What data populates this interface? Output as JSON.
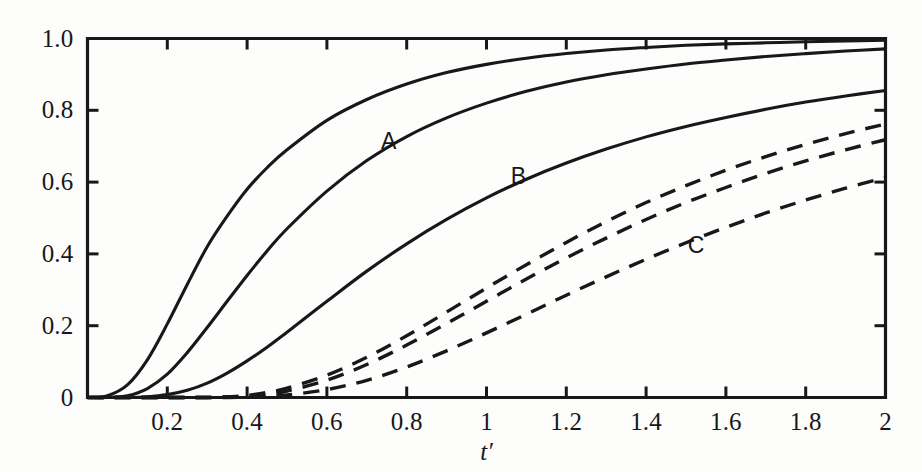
{
  "figure": {
    "background_color": "#fdfdfc",
    "ink_color": "#18181b",
    "x_axis_title": "t′"
  },
  "axes": {
    "x_ticks": [
      "0.2",
      "0.4",
      "0.6",
      "0.8",
      "1",
      "1.2",
      "1.4",
      "1.6",
      "1.8",
      "2"
    ],
    "x_tick_values": [
      0.2,
      0.4,
      0.6,
      0.8,
      1,
      1.2,
      1.4,
      1.6,
      1.8,
      2
    ],
    "y_ticks": [
      "0",
      "0.2",
      "0.4",
      "0.6",
      "0.8",
      "1.0"
    ],
    "y_tick_values": [
      0,
      0.2,
      0.4,
      0.6,
      0.8,
      1.0
    ]
  },
  "curve_labels": [
    {
      "text": "A",
      "x": 0.755,
      "y": 0.715
    },
    {
      "text": "B",
      "x": 1.08,
      "y": 0.616
    },
    {
      "text": "C",
      "x": 1.525,
      "y": 0.425
    },
    {
      "text": "D",
      "x": 2.33,
      "y": 0.465
    },
    {
      "text": "E",
      "x": 2.73,
      "y": 0.44
    },
    {
      "text": "F",
      "x": 3.14,
      "y": 0.425
    }
  ],
  "chart_data": {
    "type": "line",
    "title": "",
    "subtitle": "",
    "xlabel": "t′",
    "ylabel": "",
    "xlim": [
      0,
      2
    ],
    "ylim": [
      0,
      1.0
    ],
    "grid": false,
    "legend": "inline-curve-labels",
    "x_tick_labels": [
      "0.2",
      "0.4",
      "0.6",
      "0.8",
      "1",
      "1.2",
      "1.4",
      "1.6",
      "1.8",
      "2"
    ],
    "y_tick_labels": [
      "0",
      "0.2",
      "0.4",
      "0.6",
      "0.8",
      "1.0"
    ],
    "x": [
      0,
      0.05,
      0.1,
      0.15,
      0.2,
      0.25,
      0.3,
      0.35,
      0.4,
      0.45,
      0.5,
      0.6,
      0.7,
      0.8,
      0.9,
      1.0,
      1.1,
      1.2,
      1.3,
      1.4,
      1.5,
      1.6,
      1.7,
      1.8,
      1.9,
      2.0
    ],
    "series": [
      {
        "name": "A",
        "style": "solid",
        "color": "#18181b",
        "values": [
          0,
          0.005,
          0.035,
          0.105,
          0.205,
          0.315,
          0.42,
          0.505,
          0.58,
          0.64,
          0.69,
          0.772,
          0.83,
          0.873,
          0.905,
          0.928,
          0.945,
          0.958,
          0.968,
          0.975,
          0.981,
          0.985,
          0.988,
          0.991,
          0.993,
          0.995
        ]
      },
      {
        "name": "B",
        "style": "solid",
        "color": "#18181b",
        "values": [
          0,
          0.0,
          0.005,
          0.025,
          0.065,
          0.125,
          0.195,
          0.268,
          0.34,
          0.408,
          0.47,
          0.575,
          0.66,
          0.727,
          0.779,
          0.82,
          0.853,
          0.879,
          0.899,
          0.915,
          0.929,
          0.94,
          0.95,
          0.958,
          0.965,
          0.971
        ]
      },
      {
        "name": "C",
        "style": "solid",
        "color": "#18181b",
        "values": [
          0,
          0.0,
          0.0,
          0.002,
          0.008,
          0.02,
          0.04,
          0.068,
          0.102,
          0.14,
          0.182,
          0.268,
          0.352,
          0.428,
          0.496,
          0.556,
          0.608,
          0.653,
          0.692,
          0.726,
          0.755,
          0.78,
          0.803,
          0.823,
          0.84,
          0.855
        ]
      },
      {
        "name": "D",
        "style": "dashed",
        "color": "#18181b",
        "values": [
          0,
          0.0,
          0.0,
          0.0,
          0.0,
          0.0,
          0.0,
          0.002,
          0.006,
          0.014,
          0.026,
          0.062,
          0.112,
          0.172,
          0.238,
          0.305,
          0.37,
          0.432,
          0.49,
          0.543,
          0.59,
          0.633,
          0.671,
          0.705,
          0.735,
          0.762
        ]
      },
      {
        "name": "E",
        "style": "dashed",
        "color": "#18181b",
        "values": [
          0,
          0.0,
          0.0,
          0.0,
          0.0,
          0.0,
          0.0,
          0.001,
          0.004,
          0.009,
          0.018,
          0.048,
          0.092,
          0.146,
          0.206,
          0.268,
          0.33,
          0.389,
          0.444,
          0.496,
          0.543,
          0.585,
          0.624,
          0.659,
          0.69,
          0.718
        ]
      },
      {
        "name": "F",
        "style": "dashed",
        "color": "#18181b",
        "values": [
          0,
          0.0,
          0.0,
          0.0,
          0.0,
          0.0,
          0.0,
          0.0,
          0.001,
          0.003,
          0.007,
          0.022,
          0.048,
          0.085,
          0.13,
          0.18,
          0.232,
          0.285,
          0.336,
          0.385,
          0.431,
          0.474,
          0.514,
          0.55,
          0.583,
          0.613
        ]
      }
    ]
  }
}
